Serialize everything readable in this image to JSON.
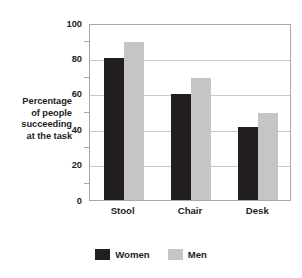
{
  "chart_data": {
    "type": "bar",
    "title": "",
    "xlabel": "",
    "ylabel": "Percentage of people succeeding at the task",
    "ylabel_lines": [
      "Percentage",
      "of people",
      "succeeding",
      "at the task"
    ],
    "categories": [
      "Stool",
      "Chair",
      "Desk"
    ],
    "series": [
      {
        "name": "Women",
        "color": "#231f20",
        "values": [
          80,
          60,
          41
        ]
      },
      {
        "name": "Men",
        "color": "#c5c5c5",
        "values": [
          89,
          69,
          49
        ]
      }
    ],
    "ylim": [
      0,
      100
    ],
    "ytick_labels": [
      "0",
      "20",
      "40",
      "60",
      "80",
      "100"
    ],
    "ytick_values": [
      0,
      20,
      40,
      60,
      80,
      100
    ],
    "yminor_tick_values": [
      10,
      30,
      50,
      70,
      90
    ],
    "grid": true,
    "grid_color": "#c9c9c9",
    "axis_color": "#a7a7a7",
    "legend_position": "bottom-center",
    "legend_entries": [
      "Women",
      "Men"
    ]
  }
}
